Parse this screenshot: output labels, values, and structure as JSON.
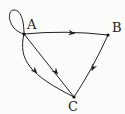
{
  "diagram": {
    "type": "directed-graph",
    "nodes": [
      {
        "id": "A",
        "label": "A",
        "x": 24,
        "y": 34
      },
      {
        "id": "B",
        "label": "B",
        "x": 108,
        "y": 35
      },
      {
        "id": "C",
        "label": "C",
        "x": 74,
        "y": 97
      }
    ],
    "edges": [
      {
        "from": "A",
        "to": "A",
        "kind": "self-loop"
      },
      {
        "from": "A",
        "to": "B",
        "kind": "straight"
      },
      {
        "from": "A",
        "to": "C",
        "kind": "curved"
      },
      {
        "from": "A",
        "to": "C",
        "kind": "straight"
      },
      {
        "from": "B",
        "to": "C",
        "kind": "straight"
      }
    ],
    "colors": {
      "edge": "#222222",
      "background": "#fbfbf9"
    }
  }
}
